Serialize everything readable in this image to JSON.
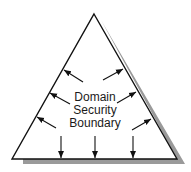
{
  "diagram": {
    "title_lines": [
      "Domain",
      "Security",
      "Boundary"
    ],
    "colors": {
      "outline": "#111111",
      "shadow": "#9a9a9a",
      "fill": "#ffffff",
      "text": "#1a1a1a"
    },
    "triangle": {
      "apex": [
        94,
        14
      ],
      "bottom_left": [
        12,
        159
      ],
      "bottom_right": [
        177,
        159
      ]
    },
    "arrows": {
      "left": [
        {
          "from": [
            83,
            82
          ],
          "to": [
            64,
            70
          ]
        },
        {
          "from": [
            70,
            104
          ],
          "to": [
            50,
            93
          ]
        },
        {
          "from": [
            56,
            128
          ],
          "to": [
            37,
            117
          ]
        }
      ],
      "right": [
        {
          "from": [
            103,
            80
          ],
          "to": [
            123,
            69
          ]
        },
        {
          "from": [
            117,
            103
          ],
          "to": [
            136,
            92
          ]
        },
        {
          "from": [
            132,
            130
          ],
          "to": [
            151,
            119
          ]
        }
      ],
      "down": [
        {
          "from": [
            61,
            136
          ],
          "to": [
            61,
            158
          ]
        },
        {
          "from": [
            95,
            136
          ],
          "to": [
            95,
            158
          ]
        },
        {
          "from": [
            133,
            136
          ],
          "to": [
            133,
            158
          ]
        }
      ]
    }
  }
}
